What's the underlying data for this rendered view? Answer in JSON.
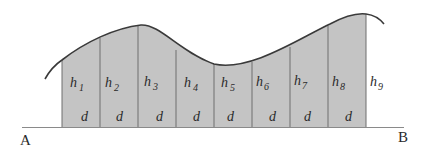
{
  "diagram": {
    "type": "area-under-curve strip division (trapezoidal/Simpson's rule)",
    "baseline": {
      "start_label": "A",
      "end_label": "B"
    },
    "strip_width_label": "d",
    "ordinates": [
      {
        "label": "h",
        "sub": "1"
      },
      {
        "label": "h",
        "sub": "2"
      },
      {
        "label": "h",
        "sub": "3"
      },
      {
        "label": "h",
        "sub": "4"
      },
      {
        "label": "h",
        "sub": "5"
      },
      {
        "label": "h",
        "sub": "6"
      },
      {
        "label": "h",
        "sub": "7"
      },
      {
        "label": "h",
        "sub": "8"
      },
      {
        "label": "h",
        "sub": "9"
      }
    ],
    "strips": [
      {
        "width": "d"
      },
      {
        "width": "d"
      },
      {
        "width": "d"
      },
      {
        "width": "d"
      },
      {
        "width": "d"
      },
      {
        "width": "d"
      },
      {
        "width": "d"
      },
      {
        "width": "d"
      }
    ],
    "colors": {
      "fill": "#c4c4c4",
      "curve": "#3a3a3a",
      "divider": "#6e6e6e",
      "baseline": "#8a8a8a",
      "text": "#2a2a2a"
    }
  }
}
